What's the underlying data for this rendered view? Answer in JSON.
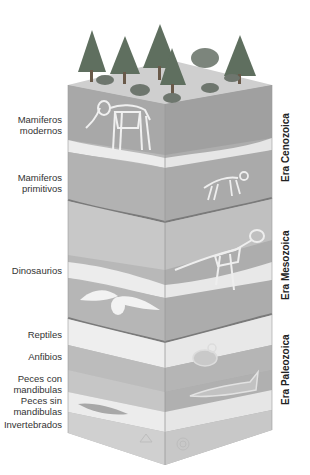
{
  "diagram": {
    "type": "geologic-column-fossil-record",
    "colors": {
      "dark_layer": "#a9a9a9",
      "mid_layer": "#bdbdbd",
      "light_layer": "#e6e6e6",
      "top_surface": "#cfcfcf",
      "boundary_line": "#7a7a7a",
      "tree": "#5f6f5f",
      "fossil": "#f2f2f2"
    },
    "organism_labels": [
      {
        "text": "Mamiferos modernos",
        "line1": "Mamiferos",
        "line2": "modernos"
      },
      {
        "text": "Mamiferos primitivos",
        "line1": "Mamiferos",
        "line2": "primitivos"
      },
      {
        "text": "Dinosaurios",
        "line1": "Dinosaurios",
        "line2": ""
      },
      {
        "text": "Reptiles",
        "line1": "Reptiles",
        "line2": ""
      },
      {
        "text": "Anfibios",
        "line1": "Anfibios",
        "line2": ""
      },
      {
        "text": "Peces con mandibulas",
        "line1": "Peces con",
        "line2": "mandibulas"
      },
      {
        "text": "Peces sin mandibulas",
        "line1": "Peces sin",
        "line2": "mandibulas"
      },
      {
        "text": "Invertebrados",
        "line1": "Invertebrados",
        "line2": ""
      }
    ],
    "eras": [
      {
        "label": "Era Cenozoica"
      },
      {
        "label": "Era Mesozoica"
      },
      {
        "label": "Era Paleozoica"
      }
    ]
  }
}
